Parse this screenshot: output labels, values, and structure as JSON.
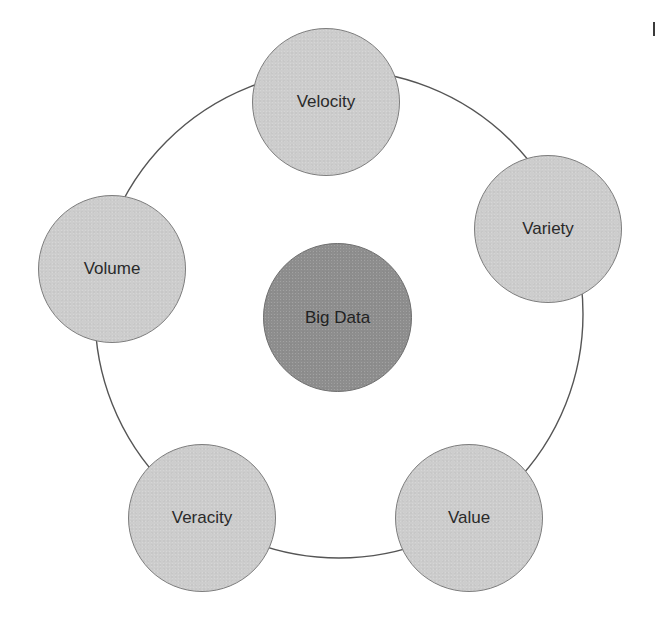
{
  "diagram": {
    "type": "radial concept diagram",
    "center": {
      "label": "Big Data",
      "fill": "#8e8e8e"
    },
    "ring": {
      "stroke": "#555555"
    },
    "nodes": [
      {
        "label": "Velocity",
        "fill": "#cdcdcd"
      },
      {
        "label": "Variety",
        "fill": "#cdcdcd"
      },
      {
        "label": "Value",
        "fill": "#cdcdcd"
      },
      {
        "label": "Veracity",
        "fill": "#cdcdcd"
      },
      {
        "label": "Volume",
        "fill": "#cdcdcd"
      }
    ]
  }
}
